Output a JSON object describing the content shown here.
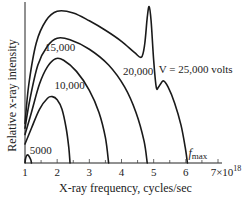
{
  "chart_data": {
    "type": "line",
    "title": "",
    "xlabel": "X-ray frequency, cycles/sec",
    "ylabel": "Relative x-ray intensity",
    "xlim": [
      1,
      7
    ],
    "x_scale_label": "×10^18",
    "x_ticks": [
      1,
      2,
      3,
      4,
      5,
      6,
      7
    ],
    "x_tick_labels": [
      "1",
      "2",
      "3",
      "4",
      "5",
      "6",
      "7×10"
    ],
    "x_tick_exponent": "18",
    "minor_ticks": [
      1.5,
      2.5,
      3.5,
      4.5,
      5.5,
      6.5
    ],
    "ylim": [
      0,
      1
    ],
    "grid": false,
    "legend": "none",
    "series": [
      {
        "name": "5000",
        "label": "5000",
        "points": [
          [
            1.0,
            0.0
          ],
          [
            1.02,
            0.03
          ],
          [
            1.06,
            0.05
          ],
          [
            1.12,
            0.045
          ],
          [
            1.18,
            0.02
          ],
          [
            1.2,
            0.0
          ]
        ]
      },
      {
        "name": "10,000",
        "label": "10,000",
        "points": [
          [
            1.0,
            0.12
          ],
          [
            1.2,
            0.22
          ],
          [
            1.45,
            0.34
          ],
          [
            1.7,
            0.41
          ],
          [
            1.85,
            0.42
          ],
          [
            2.0,
            0.4
          ],
          [
            2.15,
            0.34
          ],
          [
            2.28,
            0.22
          ],
          [
            2.36,
            0.1
          ],
          [
            2.4,
            0.0
          ]
        ]
      },
      {
        "name": "15,000",
        "label": "15,000",
        "points": [
          [
            1.0,
            0.18
          ],
          [
            1.2,
            0.32
          ],
          [
            1.45,
            0.5
          ],
          [
            1.7,
            0.61
          ],
          [
            1.95,
            0.66
          ],
          [
            2.2,
            0.65
          ],
          [
            2.6,
            0.58
          ],
          [
            3.0,
            0.46
          ],
          [
            3.3,
            0.32
          ],
          [
            3.5,
            0.16
          ],
          [
            3.6,
            0.0
          ]
        ]
      },
      {
        "name": "20,000",
        "label": "20,000",
        "points": [
          [
            1.0,
            0.22
          ],
          [
            1.15,
            0.4
          ],
          [
            1.4,
            0.62
          ],
          [
            1.7,
            0.74
          ],
          [
            2.0,
            0.79
          ],
          [
            2.4,
            0.78
          ],
          [
            3.0,
            0.72
          ],
          [
            3.6,
            0.62
          ],
          [
            4.1,
            0.48
          ],
          [
            4.45,
            0.32
          ],
          [
            4.7,
            0.14
          ],
          [
            4.8,
            0.0
          ]
        ]
      },
      {
        "name": "25,000",
        "label": "V = 25,000 volts",
        "points": [
          [
            1.0,
            0.25
          ],
          [
            1.12,
            0.5
          ],
          [
            1.35,
            0.76
          ],
          [
            1.65,
            0.9
          ],
          [
            2.0,
            0.96
          ],
          [
            2.5,
            0.95
          ],
          [
            3.0,
            0.9
          ],
          [
            3.5,
            0.84
          ],
          [
            4.0,
            0.77
          ],
          [
            4.4,
            0.7
          ],
          [
            4.62,
            0.67
          ],
          [
            4.72,
            0.75
          ],
          [
            4.8,
            0.92
          ],
          [
            4.86,
            0.99
          ],
          [
            4.92,
            0.9
          ],
          [
            5.0,
            0.65
          ],
          [
            5.08,
            0.48
          ],
          [
            5.15,
            0.48
          ],
          [
            5.3,
            0.52
          ],
          [
            5.45,
            0.48
          ],
          [
            5.65,
            0.38
          ],
          [
            5.85,
            0.24
          ],
          [
            5.98,
            0.1
          ],
          [
            6.05,
            0.0
          ]
        ]
      }
    ],
    "annotations": [
      {
        "text": "5000",
        "x": 1.15,
        "y": 0.06
      },
      {
        "text": "10,000",
        "x": 1.92,
        "y": 0.47
      },
      {
        "text": "15,000",
        "x": 1.62,
        "y": 0.71
      },
      {
        "text": "20,000",
        "x": 4.05,
        "y": 0.56
      },
      {
        "text": "V = 25,000 volts",
        "x": 5.16,
        "y": 0.57
      },
      {
        "text": "f",
        "subscript": "max",
        "x": 6.08,
        "y": 0.04
      }
    ]
  }
}
